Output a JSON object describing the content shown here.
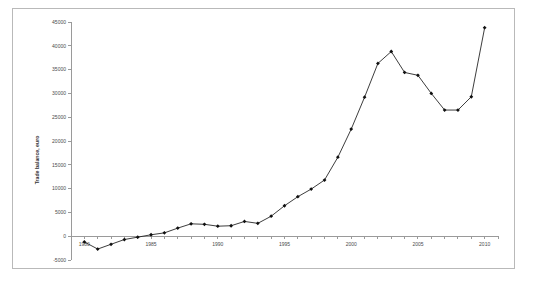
{
  "chart_data": {
    "type": "line",
    "title": "",
    "xlabel": "",
    "ylabel": "Trade balance, euro",
    "xlim": [
      1979,
      2011
    ],
    "ylim": [
      -5000,
      45000
    ],
    "xticks": [
      1980,
      1985,
      1990,
      1995,
      2000,
      2005,
      2010
    ],
    "xtick_labels": [
      "1980",
      "1985",
      "1990",
      "1995",
      "2000",
      "2005",
      "2010"
    ],
    "yticks": [
      -5000,
      0,
      5000,
      10000,
      15000,
      20000,
      25000,
      30000,
      35000,
      40000,
      45000
    ],
    "ytick_labels": [
      "-5000",
      "0",
      "5000",
      "10000",
      "15000",
      "20000",
      "25000",
      "30000",
      "35000",
      "40000",
      "45000"
    ],
    "grid": false,
    "legend": false,
    "marker": "diamond",
    "line_color": "#1a1a1a",
    "marker_color": "#101010",
    "x": [
      1980,
      1981,
      1982,
      1983,
      1984,
      1985,
      1986,
      1987,
      1988,
      1989,
      1990,
      1991,
      1992,
      1993,
      1994,
      1995,
      1996,
      1997,
      1998,
      1999,
      2000,
      2001,
      2002,
      2003,
      2004,
      2005,
      2006,
      2007,
      2008,
      2009,
      2010
    ],
    "values": [
      -1200,
      -2700,
      -1700,
      -700,
      -200,
      300,
      700,
      1700,
      2600,
      2500,
      2100,
      2200,
      3100,
      2700,
      4200,
      6400,
      8300,
      9900,
      11800,
      16600,
      22500,
      29200,
      36300,
      38800,
      34400,
      33800,
      30000,
      26500,
      26500,
      29300,
      43800
    ],
    "ymin_value": -2700,
    "ymax_value": 43800
  },
  "axis": {
    "y_title": "Trade balance, euro"
  }
}
